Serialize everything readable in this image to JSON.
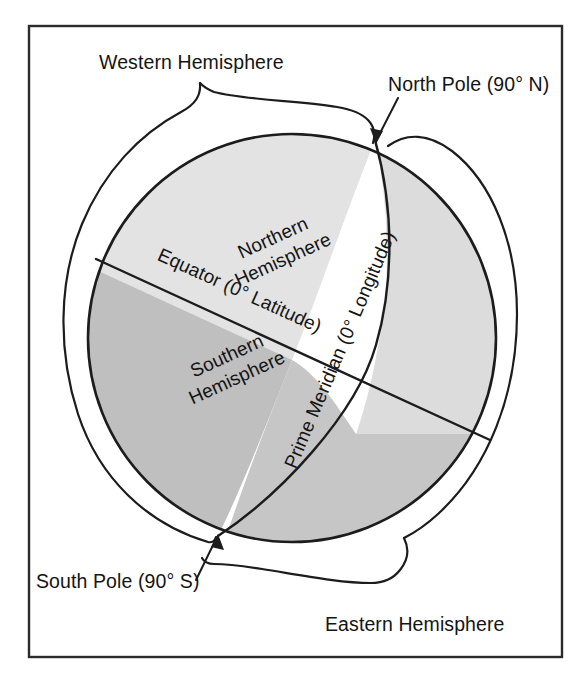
{
  "figure": {
    "kind": "globe-hemispheres-diagram",
    "background_color": "#ffffff",
    "frame_color": "#2b2b2b",
    "line_color": "#1c1c1c"
  },
  "globe": {
    "fill_north_west": "#e2e2e2",
    "fill_north_east": "#dcdcdc",
    "fill_south_west": "#c0c0c0",
    "fill_south_east": "#c7c7c7",
    "outline_color": "#1c1c1c"
  },
  "labels": {
    "western_hemisphere": "Western Hemisphere",
    "eastern_hemisphere": "Eastern Hemisphere",
    "north_pole": "North Pole (90° N)",
    "south_pole": "South Pole (90° S)",
    "northern_hemisphere_line1": "Northern",
    "northern_hemisphere_line2": "Hemisphere",
    "southern_hemisphere_line1": "Southern",
    "southern_hemisphere_line2": "Hemisphere",
    "equator": "Equator (0° Latitude)",
    "prime_meridian": "Prime Meridian (0° Longitude)"
  }
}
